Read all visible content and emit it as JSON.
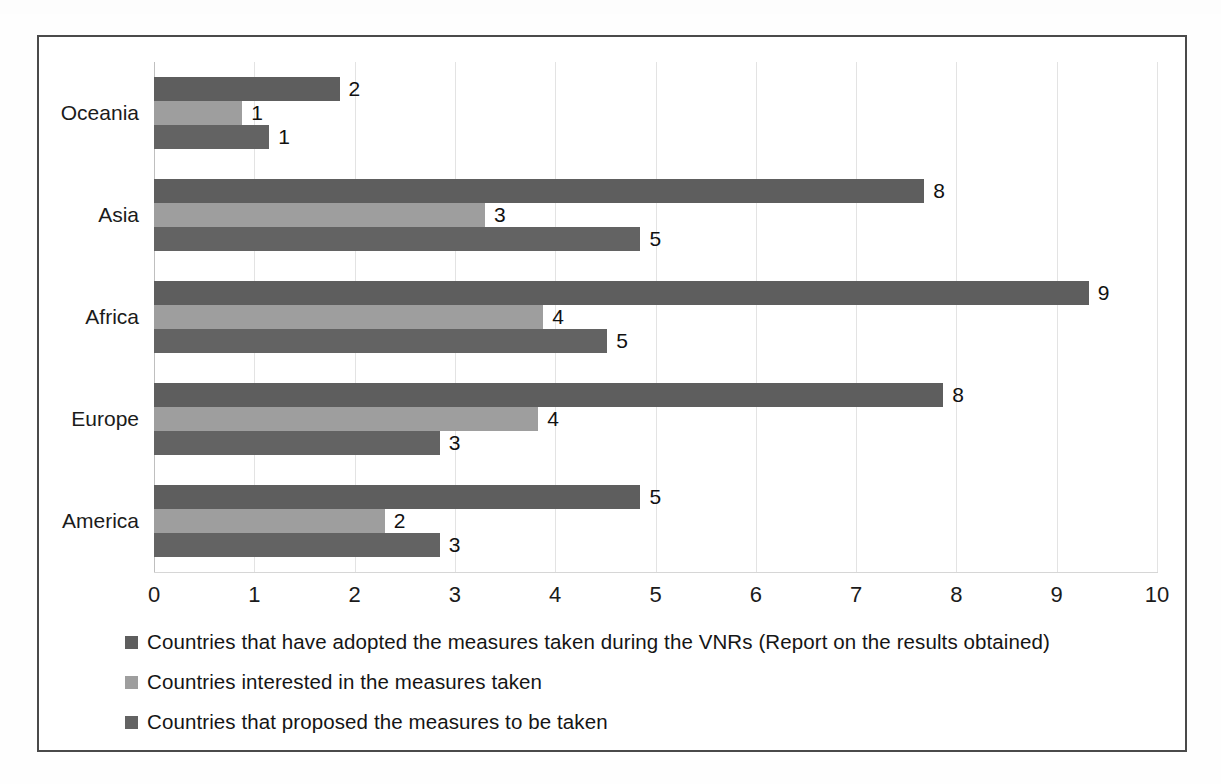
{
  "chart_data": {
    "type": "bar",
    "orientation": "horizontal",
    "title": "",
    "xlabel": "",
    "ylabel": "",
    "xlim": [
      0,
      10
    ],
    "xticks": [
      "0",
      "1",
      "2",
      "3",
      "4",
      "5",
      "6",
      "7",
      "8",
      "9",
      "10"
    ],
    "grid": true,
    "legend_position": "bottom-left",
    "categories": [
      "Oceania",
      "Asia",
      "Africa",
      "Europe",
      "America"
    ],
    "series": [
      {
        "name": "Countries that have adopted the measures taken during the VNRs (Report on the results obtained)",
        "color": "#5e5e5e",
        "values": [
          2,
          8,
          9,
          8,
          5
        ],
        "drawn_lengths": [
          1.85,
          7.68,
          9.32,
          7.87,
          4.85
        ]
      },
      {
        "name": "Countries interested in the measures taken",
        "color": "#9e9e9e",
        "values": [
          1,
          3,
          4,
          4,
          2
        ],
        "drawn_lengths": [
          0.88,
          3.3,
          3.88,
          3.83,
          2.3
        ]
      },
      {
        "name": "Countries that proposed the measures to be taken",
        "color": "#636363",
        "values": [
          1,
          5,
          5,
          3,
          3
        ],
        "drawn_lengths": [
          1.15,
          4.85,
          4.52,
          2.85,
          2.85
        ]
      }
    ]
  },
  "legend": {
    "items": [
      {
        "label": "Countries that have adopted the measures taken during the VNRs (Report on the results obtained)",
        "color": "#5e5e5e"
      },
      {
        "label": "Countries interested in the measures taken",
        "color": "#9e9e9e"
      },
      {
        "label": "Countries that proposed the measures to be taken",
        "color": "#636363"
      }
    ]
  },
  "style": {
    "frame_border": "#4a4a4a",
    "gridline": "#e3e3e3",
    "background": "#ffffff",
    "text": "#1b1b1b"
  }
}
